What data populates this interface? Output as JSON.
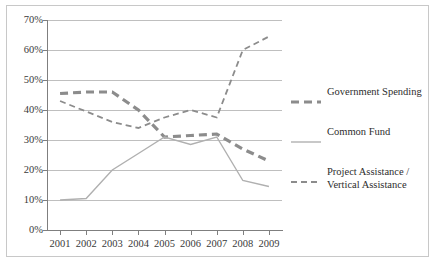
{
  "chart_data": {
    "type": "line",
    "title": "",
    "xlabel": "",
    "ylabel": "",
    "categories": [
      "2001",
      "2002",
      "2003",
      "2004",
      "2005",
      "2006",
      "2007",
      "2008",
      "2009"
    ],
    "ylim": [
      0,
      70
    ],
    "yticks": [
      "0%",
      "10%",
      "20%",
      "30%",
      "40%",
      "50%",
      "60%",
      "70%"
    ],
    "ytick_values": [
      0,
      10,
      20,
      30,
      40,
      50,
      60,
      70
    ],
    "grid": "horizontal",
    "legend_position": "right",
    "value_unit": "%",
    "series": [
      {
        "name": "Government Spending",
        "values": [
          45.5,
          46,
          46,
          40,
          31,
          31.5,
          32,
          27,
          23
        ],
        "color": "#8c8c8c",
        "style": "dashed",
        "width": 3.2
      },
      {
        "name": "Common Fund",
        "values": [
          10,
          10.5,
          20,
          25.5,
          31,
          28.5,
          31,
          16.5,
          14.5
        ],
        "color": "#b0b0b0",
        "style": "solid",
        "width": 1.4
      },
      {
        "name": "Project Assistance / Vertical Assistance",
        "values": [
          43,
          39.5,
          36,
          34,
          37.5,
          40,
          37.5,
          60,
          64.5
        ],
        "color": "#8c8c8c",
        "style": "dashed",
        "width": 1.8
      }
    ]
  },
  "legend": {
    "items": [
      {
        "label": "Government Spending"
      },
      {
        "label": "Common Fund"
      },
      {
        "label": "Project Assistance /\nVertical Assistance"
      }
    ]
  },
  "colors": {
    "grid": "#bfbfbf",
    "axis": "#7f7f7f",
    "frame": "#c8c8c8",
    "text": "#3a3a3a",
    "background": "#ffffff"
  }
}
